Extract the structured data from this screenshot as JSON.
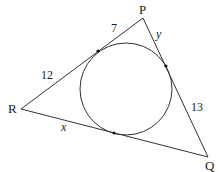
{
  "figure": {
    "type": "triangle-incircle",
    "vertices": {
      "P": {
        "label": "P",
        "x": 143,
        "y": 18
      },
      "Q": {
        "label": "Q",
        "x": 208,
        "y": 157
      },
      "R": {
        "label": "R",
        "x": 21,
        "y": 109
      }
    },
    "incircle": {
      "cx": 126,
      "cy": 89,
      "r": 46
    },
    "tangent_points": [
      {
        "side": "PR",
        "x": 98,
        "y": 51
      },
      {
        "side": "PQ",
        "x": 166,
        "y": 66
      },
      {
        "side": "RQ",
        "x": 114,
        "y": 133
      }
    ],
    "segment_labels": {
      "p_to_tangent_on_pr": "7",
      "r_to_tangent_on_pr": "12",
      "p_to_tangent_on_pq": "y",
      "q_to_tangent_on_pq": "13",
      "r_to_tangent_on_rq": "x"
    },
    "colors": {
      "stroke": "#333333",
      "text": "#222222"
    }
  }
}
